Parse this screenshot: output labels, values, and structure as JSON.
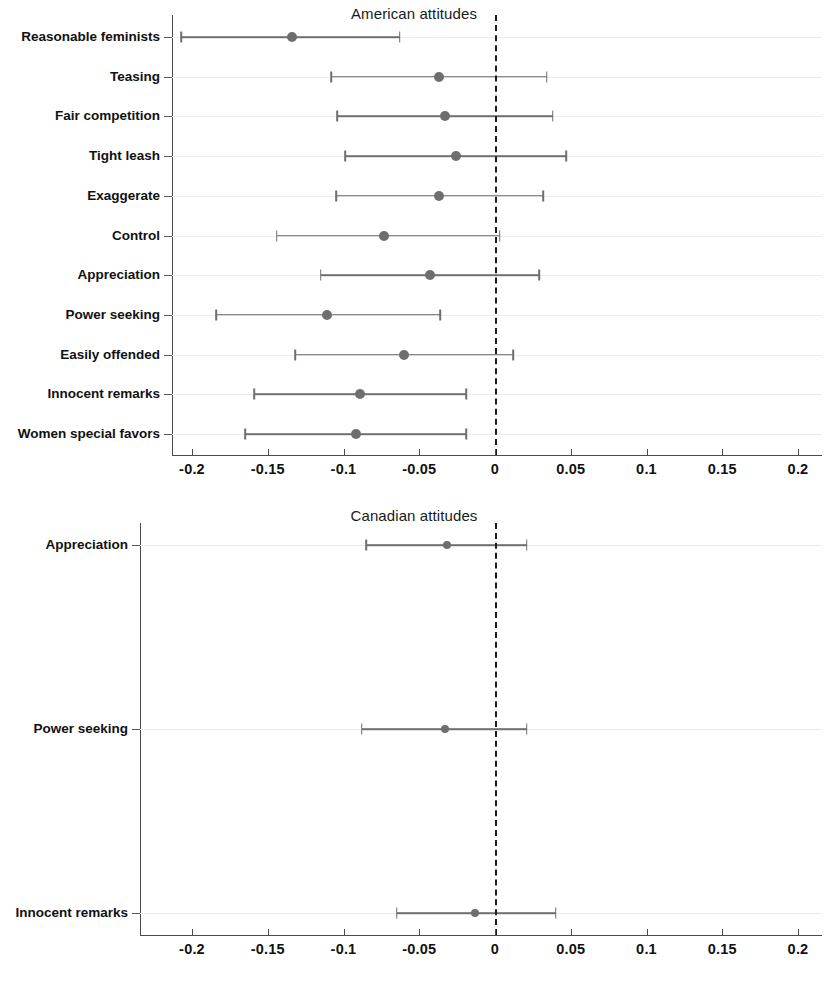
{
  "figure": {
    "width": 828,
    "height": 990,
    "point_color": "#6e6e6e",
    "zero_line_color": "#1c1c1c",
    "grid_color": "#ededed",
    "axis_color": "#4a4a4a"
  },
  "chart_data": [
    {
      "type": "scatter",
      "subtype": "forest-plot",
      "title": "American attitudes",
      "xlabel": "",
      "ylabel": "",
      "xlim": [
        -0.225,
        0.215
      ],
      "xticks": [
        -0.2,
        -0.15,
        -0.1,
        -0.05,
        0,
        0.05,
        0.1,
        0.15,
        0.2
      ],
      "xticklabels": [
        "-0.2",
        "-0.15",
        "-0.1",
        "-0.05",
        "0",
        "0.05",
        "0.1",
        "0.15",
        "0.2"
      ],
      "grid": true,
      "legend": "none",
      "reference_line": 0,
      "categories": [
        "Reasonable feminists",
        "Teasing",
        "Fair competition",
        "Tight leash",
        "Exaggerate",
        "Control",
        "Appreciation",
        "Power seeking",
        "Easily offended",
        "Innocent remarks",
        "Women special favors"
      ],
      "estimates": [
        -0.134,
        -0.037,
        -0.033,
        -0.026,
        -0.037,
        -0.073,
        -0.043,
        -0.111,
        -0.06,
        -0.089,
        -0.092
      ],
      "ci_low": [
        -0.207,
        -0.108,
        -0.104,
        -0.099,
        -0.105,
        -0.144,
        -0.115,
        -0.184,
        -0.132,
        -0.159,
        -0.165
      ],
      "ci_high": [
        -0.063,
        0.034,
        0.038,
        0.047,
        0.032,
        0.003,
        0.029,
        -0.036,
        0.012,
        -0.019,
        -0.019
      ]
    },
    {
      "type": "scatter",
      "subtype": "forest-plot",
      "title": "Canadian attitudes",
      "xlabel": "",
      "ylabel": "",
      "xlim": [
        -0.225,
        0.215
      ],
      "xticks": [
        -0.2,
        -0.15,
        -0.1,
        -0.05,
        0,
        0.05,
        0.1,
        0.15,
        0.2
      ],
      "xticklabels": [
        "-0.2",
        "-0.15",
        "-0.1",
        "-0.05",
        "0",
        "0.05",
        "0.1",
        "0.15",
        "0.2"
      ],
      "grid": true,
      "legend": "none",
      "reference_line": 0,
      "categories": [
        "Appreciation",
        "Power seeking",
        "Innocent remarks"
      ],
      "estimates": [
        -0.032,
        -0.033,
        -0.013
      ],
      "ci_low": [
        -0.085,
        -0.088,
        -0.065
      ],
      "ci_high": [
        0.021,
        0.021,
        0.04
      ]
    }
  ]
}
